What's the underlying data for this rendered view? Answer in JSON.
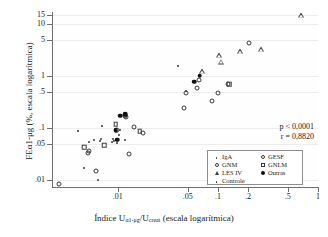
{
  "chart_data": {
    "type": "scatter",
    "title": "",
    "xlabel": "Índice Uα1-μg/Ucreat (escala logarítmica)",
    "xlabel_parts": {
      "prefix": "Índice U",
      "sub1": "α1-μg",
      "mid": "/U",
      "sub2": "creat",
      "suffix": " (escala logarítmica)"
    },
    "ylabel": "FEα1-μg (%, escala logarítmica)",
    "xscale": "log",
    "yscale": "log",
    "xlim": [
      0.0022,
      1.0
    ],
    "ylim": [
      0.0075,
      17.0
    ],
    "grid": true,
    "grid_axis": "y",
    "xticks": [
      0.01,
      0.05,
      0.1,
      0.2,
      0.5,
      1
    ],
    "xtick_labels": [
      ".01",
      ".05",
      ".1",
      ".2",
      ".5",
      "1"
    ],
    "yticks": [
      0.01,
      0.05,
      0.1,
      0.5,
      1,
      5,
      10,
      15
    ],
    "ytick_labels": [
      ".01",
      ".05",
      ".1",
      ".5",
      "1",
      "5",
      "10",
      "15"
    ],
    "annotations": {
      "p_value": "p < 0,0001",
      "r_value": "r = 0,8820"
    },
    "legend": {
      "position": "lower-right",
      "entries": [
        {
          "label": "IgA",
          "marker": "dot"
        },
        {
          "label": "GESF",
          "marker": "open-circle"
        },
        {
          "label": "GNM",
          "marker": "open-circle"
        },
        {
          "label": "GNLM",
          "marker": "open-square"
        },
        {
          "label": "LES IV",
          "marker": "open-triangle"
        },
        {
          "label": "Outras",
          "marker": "filled-circle"
        },
        {
          "label": "Controle",
          "marker": "dot"
        }
      ]
    },
    "series": [
      {
        "name": "Controle",
        "marker": "dot",
        "points": [
          [
            0.004,
            0.09
          ],
          [
            0.0052,
            0.055
          ],
          [
            0.0058,
            0.06
          ],
          [
            0.0066,
            0.058
          ],
          [
            0.0068,
            0.063
          ],
          [
            0.007,
            0.11
          ],
          [
            0.0088,
            0.055
          ],
          [
            0.0092,
            0.058
          ],
          [
            0.0098,
            0.052
          ],
          [
            0.01,
            0.061
          ],
          [
            0.0103,
            0.075
          ],
          [
            0.0118,
            0.06
          ],
          [
            0.0046,
            0.017
          ],
          [
            0.0064,
            0.01
          ],
          [
            0.04,
            1.6
          ],
          [
            0.009,
            0.062
          ]
        ]
      },
      {
        "name": "IgA",
        "marker": "dot",
        "points": [
          [
            0.0094,
            0.088
          ],
          [
            0.0106,
            0.092
          ],
          [
            0.0122,
            0.175
          ],
          [
            0.048,
            0.52
          ]
        ]
      },
      {
        "name": "GESF",
        "marker": "open-circle",
        "points": [
          [
            0.0026,
            0.0085
          ],
          [
            0.005,
            0.034
          ],
          [
            0.0051,
            0.037
          ],
          [
            0.0128,
            0.032
          ],
          [
            0.0121,
            0.168
          ],
          [
            0.0145,
            0.105
          ],
          [
            0.018,
            0.082
          ],
          [
            0.048,
            0.47
          ],
          [
            0.0455,
            0.25
          ],
          [
            0.062,
            0.59
          ],
          [
            0.064,
            0.83
          ],
          [
            0.087,
            0.33
          ],
          [
            0.1,
            0.48
          ],
          [
            0.125,
            0.72
          ],
          [
            0.205,
            4.3
          ]
        ]
      },
      {
        "name": "GNM",
        "marker": "open-circle",
        "points": [
          [
            0.0118,
            0.172
          ],
          [
            0.006,
            0.0155
          ],
          [
            0.0098,
            0.092
          ]
        ]
      },
      {
        "name": "GNLM",
        "marker": "open-square",
        "points": [
          [
            0.0046,
            0.043
          ],
          [
            0.0073,
            0.047
          ],
          [
            0.0095,
            0.12
          ],
          [
            0.0165,
            0.088
          ],
          [
            0.13,
            0.7
          ]
        ]
      },
      {
        "name": "LES IV",
        "marker": "open-triangle",
        "points": [
          [
            0.096,
            2.55
          ],
          [
            0.1,
            1.9
          ],
          [
            0.155,
            3.05
          ],
          [
            0.25,
            3.35
          ],
          [
            0.63,
            15.0
          ],
          [
            0.064,
            1.25
          ]
        ]
      },
      {
        "name": "Outras",
        "marker": "filled-circle",
        "points": [
          [
            0.0095,
            0.093
          ],
          [
            0.0118,
            0.188
          ],
          [
            0.0105,
            0.176
          ],
          [
            0.058,
            0.79
          ],
          [
            0.066,
            1.03
          ],
          [
            0.0098,
            0.06
          ]
        ]
      }
    ]
  }
}
